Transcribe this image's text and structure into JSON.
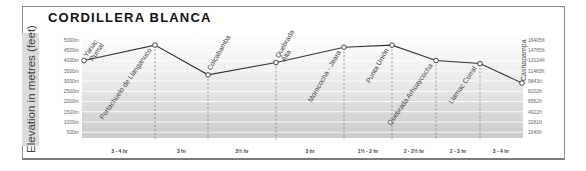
{
  "title": "CORDILLERA BLANCA",
  "y_axis_label": "Elevation in metres (feet)",
  "colors": {
    "band_top": "#f4f4f4",
    "band_bottom": "#cfcfcf",
    "line": "#333333",
    "frame": "#8a8a8a"
  },
  "chart_data": {
    "type": "line",
    "title": "CORDILLERA BLANCA",
    "xlabel": "",
    "ylabel": "Elevation in metres (feet)",
    "ylim": [
      0,
      5000
    ],
    "grid": true,
    "y_ticks_left": [
      "5000m",
      "4500m",
      "4000m",
      "3500m",
      "3000m",
      "2500m",
      "2000m",
      "1500m",
      "1000m",
      "500m"
    ],
    "y_ticks_right": [
      "16405ft",
      "14765ft",
      "13124ft",
      "11483ft",
      "9843ft",
      "8202ft",
      "6562ft",
      "4922ft",
      "3281ft",
      "1640ft"
    ],
    "categories": [
      "Yanac Pumal",
      "Portachuelo de Llanganuco",
      "Colcabamba",
      "Quebrada Alta",
      "Morococha - Jeara",
      "Punta Unión",
      "Quebrada Arhuaycocha",
      "Llamac Corral",
      "Cashapampa"
    ],
    "values": [
      4000,
      4750,
      3300,
      3900,
      4650,
      4750,
      4000,
      3850,
      2900
    ],
    "segment_times": [
      "3 - 4 hr",
      "3 hr",
      "3½ hr",
      "3 hr",
      "1½ - 2 hr",
      "2 - 2½ hr",
      "2 - 3 hr",
      "3 - 4 hr"
    ]
  }
}
